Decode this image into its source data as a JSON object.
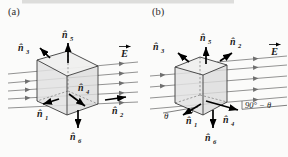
{
  "figure": {
    "panels": [
      {
        "tag": "(a)",
        "field_vector_label": "E",
        "normals": {
          "n1": {
            "base": "n̂",
            "sub": "1"
          },
          "n2": {
            "base": "n̂",
            "sub": "2"
          },
          "n3": {
            "base": "n̂",
            "sub": "3"
          },
          "n4": {
            "base": "n̂",
            "sub": "4"
          },
          "n5": {
            "base": "n̂",
            "sub": "5"
          },
          "n6": {
            "base": "n̂",
            "sub": "6"
          }
        }
      },
      {
        "tag": "(b)",
        "field_vector_label": "E",
        "normals": {
          "n1": {
            "base": "n̂",
            "sub": "1"
          },
          "n2": {
            "base": "n̂",
            "sub": "2"
          },
          "n3": {
            "base": "n̂",
            "sub": "3"
          },
          "n4": {
            "base": "n̂",
            "sub": "4"
          },
          "n5": {
            "base": "n̂",
            "sub": "5"
          },
          "n6": {
            "base": "n̂",
            "sub": "6"
          }
        },
        "angles": {
          "theta": "θ",
          "ninety_minus_theta": "90° − θ"
        }
      }
    ],
    "colors": {
      "background": "#fbfbfa",
      "edge": "#3a3a3a",
      "field_line": "#6f6f6f",
      "arrow": "#000000",
      "cube_fill": "#e2e2e2",
      "cube_top_fill": "#efefee",
      "cube_right_fill": "#dcdcdc"
    }
  }
}
